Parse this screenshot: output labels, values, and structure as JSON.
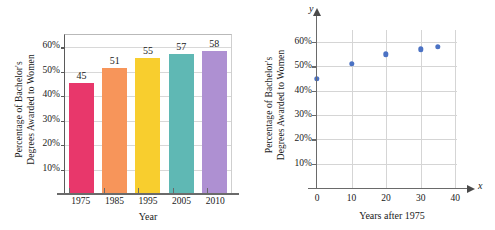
{
  "figure": {
    "panels": [
      {
        "id": "bar-panel",
        "ylabel_line1": "Percentage of Bachelor's",
        "ylabel_line2": "Degrees Awarded to Women",
        "xlabel": "Year"
      },
      {
        "id": "scatter-panel",
        "ylabel_line1": "Percentage of Bachelor's",
        "ylabel_line2": "Degrees Awarded to Women",
        "xlabel": "Years after 1975",
        "x_axis_letter": "x",
        "y_axis_letter": "y"
      }
    ]
  },
  "chart_data": [
    {
      "type": "bar",
      "title": "",
      "categories": [
        "1975",
        "1985",
        "1995",
        "2005",
        "2010"
      ],
      "values": [
        45,
        51,
        55,
        57,
        58
      ],
      "data_labels": [
        "45",
        "51",
        "55",
        "57",
        "58"
      ],
      "colors": [
        "#E8376B",
        "#F7955A",
        "#F8CE2E",
        "#5FB8B4",
        "#AE90D2"
      ],
      "xlabel": "Year",
      "ylabel": "Percentage of Bachelor's Degrees Awarded to Women",
      "ylim": [
        0,
        65
      ],
      "yticks": [
        10,
        20,
        30,
        40,
        50,
        60
      ],
      "ytick_labels": [
        "10%",
        "20%",
        "30%",
        "40%",
        "50%",
        "60%"
      ],
      "grid": true,
      "legend": "none"
    },
    {
      "type": "scatter",
      "title": "",
      "x": [
        0,
        10,
        20,
        30,
        35
      ],
      "y": [
        45,
        51,
        55,
        57,
        58
      ],
      "point_color": "#4B72C4",
      "xlabel": "Years after 1975",
      "ylabel": "Percentage of Bachelor's Degrees Awarded to Women",
      "xlim": [
        0,
        44
      ],
      "ylim": [
        0,
        65
      ],
      "xticks": [
        0,
        10,
        20,
        30,
        40
      ],
      "xtick_labels": [
        "0",
        "10",
        "20",
        "30",
        "40"
      ],
      "yticks": [
        10,
        20,
        30,
        40,
        50,
        60
      ],
      "ytick_labels": [
        "10%",
        "20%",
        "30%",
        "40%",
        "50%",
        "60%"
      ],
      "grid": true,
      "legend": "none"
    }
  ]
}
